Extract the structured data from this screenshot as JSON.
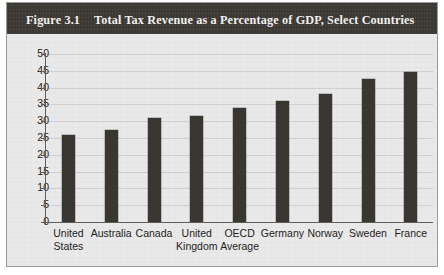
{
  "figure": {
    "number": "Figure 3.1",
    "title": "Total Tax Revenue as a Percentage of GDP, Select Countries"
  },
  "colors": {
    "title_bar_bg": "#3b3733",
    "title_text": "#f2f1ef",
    "plot_bg": "#e9e9e9",
    "bar": "#3a3632",
    "axis": "#5d5d5d",
    "border": "#9a9a9a"
  },
  "chart_data": {
    "type": "bar",
    "title": "Total Tax Revenue as a Percentage of GDP, Select Countries",
    "xlabel": "",
    "ylabel": "",
    "ylim": [
      0,
      50
    ],
    "yticks": [
      0,
      5,
      10,
      15,
      20,
      25,
      30,
      35,
      40,
      45,
      50
    ],
    "grid": true,
    "legend": false,
    "categories": [
      "United States",
      "Australia",
      "Canada",
      "United Kingdom",
      "OECD Average",
      "Germany",
      "Norway",
      "Sweden",
      "France"
    ],
    "category_lines": [
      [
        "United",
        "States"
      ],
      [
        "Australia",
        ""
      ],
      [
        "Canada",
        ""
      ],
      [
        "United",
        "Kingdom"
      ],
      [
        "OECD",
        "Average"
      ],
      [
        "Germany",
        ""
      ],
      [
        "Norway",
        ""
      ],
      [
        "Sweden",
        ""
      ],
      [
        "France",
        ""
      ]
    ],
    "values": [
      26,
      27.5,
      31,
      31.5,
      34,
      36,
      38,
      42.5,
      44.5
    ]
  }
}
